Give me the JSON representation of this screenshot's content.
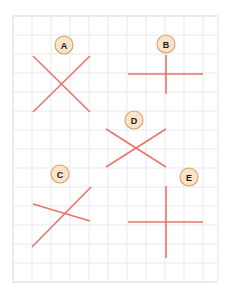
{
  "canvas": {
    "width": 235,
    "height": 292,
    "background": "#ffffff"
  },
  "grid": {
    "x": 13,
    "y": 16,
    "width": 205,
    "height": 266,
    "cell": 19,
    "line_color": "#e8e9ee",
    "border_color": "#e2e3e9"
  },
  "style": {
    "stroke_color": "#e8756b",
    "stroke_width": 1.6,
    "badge_fill": "#fbe3c8",
    "badge_stroke": "#d9a168",
    "badge_radius": 9,
    "badge_text_color": "#1a1a1a"
  },
  "shapes": [
    {
      "id": "A",
      "label": "A",
      "kind": "x-cross",
      "badge": {
        "cx": 64,
        "cy": 45
      },
      "segments": [
        {
          "x1": 33,
          "y1": 56,
          "x2": 90,
          "y2": 112
        },
        {
          "x1": 90,
          "y1": 56,
          "x2": 33,
          "y2": 112
        }
      ]
    },
    {
      "id": "B",
      "label": "B",
      "kind": "plus-cross",
      "badge": {
        "cx": 166,
        "cy": 44
      },
      "segments": [
        {
          "x1": 128,
          "y1": 74,
          "x2": 203,
          "y2": 74
        },
        {
          "x1": 166,
          "y1": 55,
          "x2": 166,
          "y2": 94
        }
      ]
    },
    {
      "id": "C",
      "label": "C",
      "kind": "x-cross-skewed",
      "badge": {
        "cx": 60,
        "cy": 174
      },
      "segments": [
        {
          "x1": 32,
          "y1": 247,
          "x2": 91,
          "y2": 187
        },
        {
          "x1": 33,
          "y1": 204,
          "x2": 90,
          "y2": 221
        }
      ]
    },
    {
      "id": "D",
      "label": "D",
      "kind": "x-cross",
      "badge": {
        "cx": 134,
        "cy": 120
      },
      "segments": [
        {
          "x1": 106,
          "y1": 129,
          "x2": 166,
          "y2": 167
        },
        {
          "x1": 166,
          "y1": 129,
          "x2": 106,
          "y2": 167
        }
      ]
    },
    {
      "id": "E",
      "label": "E",
      "kind": "plus-cross",
      "badge": {
        "cx": 189,
        "cy": 177
      },
      "segments": [
        {
          "x1": 128,
          "y1": 222,
          "x2": 203,
          "y2": 222
        },
        {
          "x1": 166,
          "y1": 186,
          "x2": 166,
          "y2": 258
        }
      ]
    }
  ]
}
